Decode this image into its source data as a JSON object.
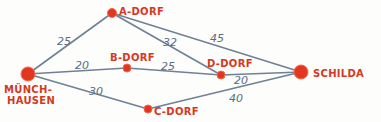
{
  "diagram": {
    "type": "weighted-graph",
    "colors": {
      "node": "#e2361e",
      "edge": "#6f8194",
      "weight_text": "#5a6c85",
      "node_label": "#d6381f"
    },
    "nodes": [
      {
        "id": "muenchhausen",
        "label_line1": "MÜNCH-",
        "label_line2": "HAUSEN",
        "x": 28,
        "y": 74,
        "r": 7
      },
      {
        "id": "a",
        "label": "A-DORF",
        "x": 112,
        "y": 13,
        "r": 4.5
      },
      {
        "id": "b",
        "label": "B-DORF",
        "x": 127,
        "y": 68,
        "r": 4
      },
      {
        "id": "c",
        "label": "C-DORF",
        "x": 148,
        "y": 109,
        "r": 4
      },
      {
        "id": "d",
        "label": "D-DORF",
        "x": 221,
        "y": 75,
        "r": 4
      },
      {
        "id": "schilda",
        "label": "SCHILDA",
        "x": 301,
        "y": 72,
        "r": 7
      }
    ],
    "edges": [
      {
        "from": "muenchhausen",
        "to": "a",
        "weight": "25"
      },
      {
        "from": "muenchhausen",
        "to": "b",
        "weight": "20"
      },
      {
        "from": "muenchhausen",
        "to": "c",
        "weight": "30"
      },
      {
        "from": "a",
        "to": "d",
        "weight": "32"
      },
      {
        "from": "a",
        "to": "schilda",
        "weight": "45"
      },
      {
        "from": "b",
        "to": "d",
        "weight": "25"
      },
      {
        "from": "d",
        "to": "schilda",
        "weight": "20"
      },
      {
        "from": "c",
        "to": "schilda",
        "weight": "40"
      }
    ]
  }
}
